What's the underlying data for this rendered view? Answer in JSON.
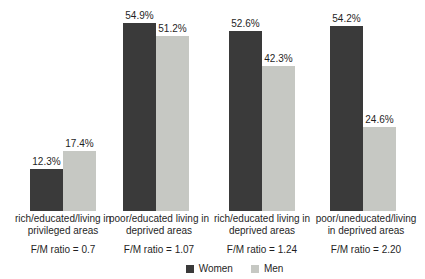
{
  "chart_data": {
    "type": "bar",
    "title": "",
    "xlabel": "",
    "ylabel": "",
    "ylim": [
      0,
      60
    ],
    "grid": false,
    "legend_position": "bottom-center",
    "axes_visible": false,
    "categories": [
      "rich/educated/living in privileged areas",
      "poor/educated living in deprived areas",
      "rich/educated living in deprived areas",
      "poor/uneducated/living in deprived areas"
    ],
    "category_lines": [
      [
        "rich/educated/living in",
        "privileged areas"
      ],
      [
        "poor/educated living in",
        "deprived areas"
      ],
      [
        "rich/educated living in",
        "deprived areas"
      ],
      [
        "poor/uneducated/living",
        "in deprived areas"
      ]
    ],
    "ratio_labels": [
      "F/M ratio = 0.7",
      "F/M ratio = 1.07",
      "F/M ratio = 1.24",
      "F/M ratio = 2.20"
    ],
    "series": [
      {
        "name": "Women",
        "color": "#3a3a3a",
        "values": [
          12.3,
          54.9,
          52.6,
          54.2
        ],
        "value_labels": [
          "12.3%",
          "54.9%",
          "52.6%",
          "54.2%"
        ]
      },
      {
        "name": "Men",
        "color": "#c6c8c3",
        "values": [
          17.4,
          51.2,
          42.3,
          24.6
        ],
        "value_labels": [
          "17.4%",
          "51.2%",
          "42.3%",
          "24.6%"
        ]
      }
    ]
  }
}
